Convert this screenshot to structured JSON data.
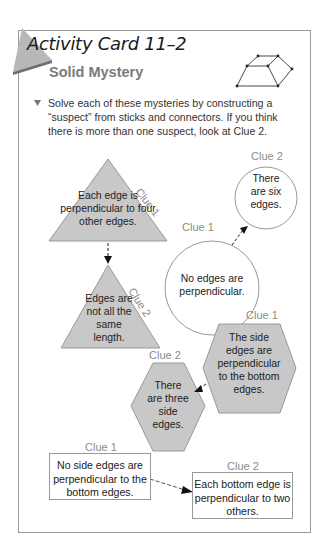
{
  "card": {
    "title": "Activity Card 11–2",
    "subtitle": "Solid Mystery",
    "icon": "prism-figure-icon",
    "instructions": "Solve each of these mysteries by constructing a “suspect” from sticks and connectors. If you think there is more than one suspect, look at Clue 2.",
    "bullet_icon": "triangle-down-bullet"
  },
  "mysteries": [
    {
      "shape": "triangle",
      "clue1": {
        "label": "Clue 1",
        "text": "Each edge is perpendicular to four other edges."
      },
      "clue2": {
        "label": "Clue 2",
        "text": "Edges are not all the same length."
      }
    },
    {
      "shape": "circle",
      "clue1": {
        "label": "Clue 1",
        "text": "No edges are perpendicular."
      },
      "clue2": {
        "label": "Clue 2",
        "text": "There are six edges."
      }
    },
    {
      "shape": "hexagon",
      "clue1": {
        "label": "Clue 1",
        "text": "The side edges are perpendicular to the bottom edges."
      },
      "clue2": {
        "label": "Clue 2",
        "text": "There are three side edges."
      }
    },
    {
      "shape": "rectangle",
      "clue1": {
        "label": "Clue 1",
        "text": "No side edges are perpendicular to the bottom edges."
      },
      "clue2": {
        "label": "Clue 2",
        "text": "Each bottom edge is perpendicular to two others."
      }
    }
  ],
  "colors": {
    "shape_fill": "#c8c8c8",
    "corner_tab": "#b4b4b4",
    "corner_dark": "#7a7a7a",
    "clue_label": "#8a8a8a"
  }
}
